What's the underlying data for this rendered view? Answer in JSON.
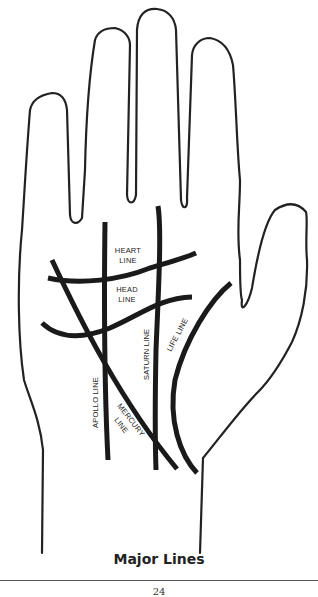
{
  "figure": {
    "caption": "Major Lines",
    "page_number": "24",
    "line_color": "#1a1a1a",
    "background": "#ffffff"
  },
  "labels": {
    "heart_line": [
      "HEART",
      "LINE"
    ],
    "head_line": [
      "HEAD",
      "LINE"
    ],
    "saturn_line": "SATURN LINE",
    "life_line": "LIFE LINE",
    "apollo_line": "APOLLO LINE",
    "mercury_line": [
      "MERCURY",
      "LINE"
    ]
  }
}
